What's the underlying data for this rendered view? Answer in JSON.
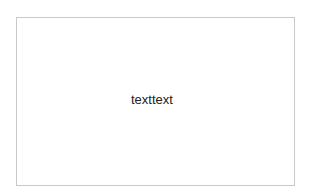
{
  "box": {
    "text": "texttext",
    "border_color": "#c9c9c9",
    "background": "#ffffff"
  }
}
